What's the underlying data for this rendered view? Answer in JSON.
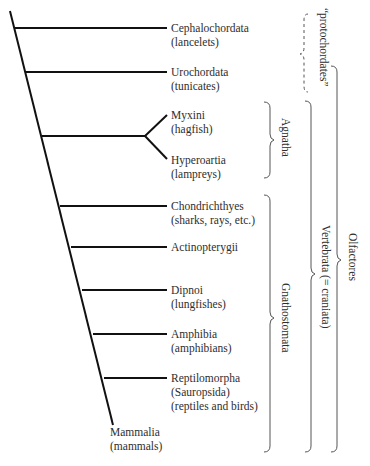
{
  "diagram": {
    "type": "cladogram",
    "taxa": [
      {
        "name": "Cephalochordata",
        "common": "(lancelets)"
      },
      {
        "name": "Urochordata",
        "common": "(tunicates)"
      },
      {
        "name": "Myxini",
        "common": "(hagfish)"
      },
      {
        "name": "Hyperoartia",
        "common": "(lampreys)"
      },
      {
        "name": "Chondrichthyes",
        "common": "(sharks, rays, etc.)"
      },
      {
        "name": "Actinopterygii",
        "common": ""
      },
      {
        "name": "Dipnoi",
        "common": "(lungfishes)"
      },
      {
        "name": "Amphibia",
        "common": "(amphibians)"
      },
      {
        "name": "Reptilomorpha",
        "common": "(Sauropsida)",
        "common2": "(reptiles and birds)"
      },
      {
        "name": "Mammalia",
        "common": "(mammals)"
      }
    ],
    "groups": [
      {
        "label": "“protochordates”",
        "style": "dashed"
      },
      {
        "label": "Agnatha",
        "style": "solid"
      },
      {
        "label": "Gnathostomata",
        "style": "solid"
      },
      {
        "label": "Vertebrata (= craniata)",
        "style": "solid"
      },
      {
        "label": "Olfactores",
        "style": "solid"
      }
    ],
    "colors": {
      "line": "#111111",
      "bracket": "#555555",
      "text": "#2e2e2e"
    }
  }
}
